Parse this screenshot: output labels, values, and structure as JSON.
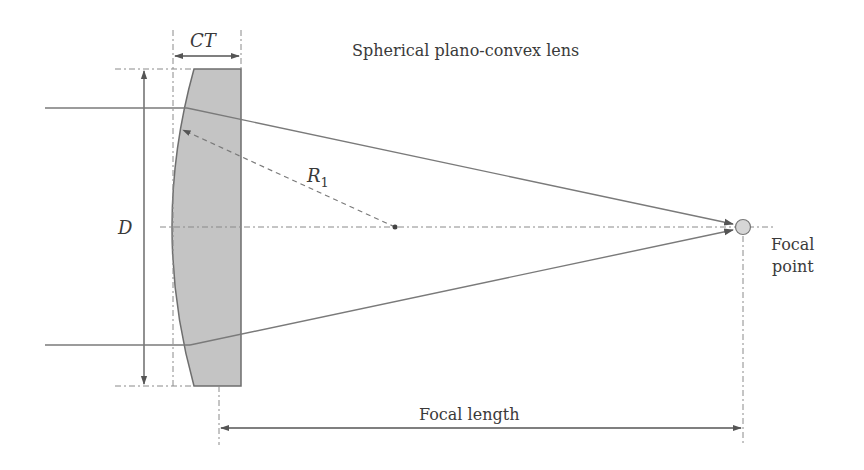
{
  "diagram": {
    "title": "Spherical plano-convex lens",
    "labels": {
      "center_thickness": "CT",
      "diameter": "D",
      "radius": "R",
      "radius_subscript": "1",
      "focal_length": "Focal length",
      "focal_point_line1": "Focal",
      "focal_point_line2": "point"
    },
    "colors": {
      "lens_fill": "#c4c4c4",
      "line": "#6e6e6e",
      "text": "#3a3a3a",
      "focal_point_fill": "#d6d6d6"
    }
  }
}
